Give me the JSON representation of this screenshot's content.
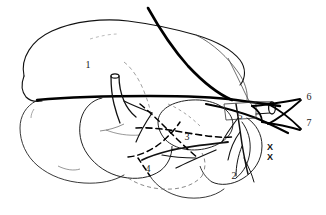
{
  "figure": {
    "kind": "anatomical-line-drawing",
    "background_color": "#ffffff",
    "ink_color": "#000000",
    "thin_ink_color": "#333333",
    "width": 326,
    "height": 215,
    "labels": [
      {
        "id": "label-1",
        "text": "1",
        "x": 88,
        "y": 65
      },
      {
        "id": "label-2",
        "text": "2",
        "x": 234,
        "y": 176
      },
      {
        "id": "label-3",
        "text": "3",
        "x": 187,
        "y": 137
      },
      {
        "id": "label-4",
        "text": "4",
        "x": 148,
        "y": 169
      },
      {
        "id": "label-5",
        "text": "5",
        "x": 240,
        "y": 116
      },
      {
        "id": "label-6",
        "text": "6",
        "x": 309,
        "y": 97
      },
      {
        "id": "label-7",
        "text": "7",
        "x": 309,
        "y": 123
      }
    ],
    "marks": [
      {
        "id": "x-mark-upper",
        "text": "X",
        "x": 270,
        "y": 147
      },
      {
        "id": "x-mark-lower",
        "text": "X",
        "x": 270,
        "y": 157
      }
    ]
  }
}
